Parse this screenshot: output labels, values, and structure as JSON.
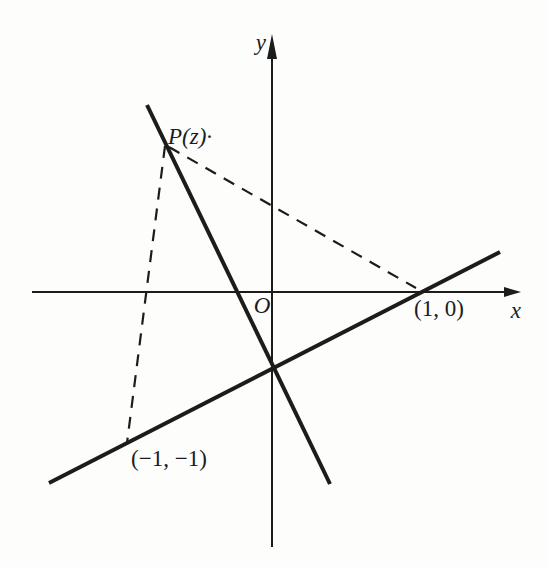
{
  "colors": {
    "background": "#fdfdfc",
    "ink": "#1c1c1c"
  },
  "labels": {
    "y_axis": "y",
    "x_axis": "x",
    "origin": "O",
    "point_p": "P(z)·",
    "point_1_0": "(1, 0)",
    "point_m1_m1": "(−1, −1)"
  },
  "geometry": {
    "x_axis": {
      "x1": 32,
      "y1": 292,
      "x2": 507,
      "y2": 292
    },
    "x_axis_arrow": {
      "points": "521,292 504,287 504,297"
    },
    "y_axis": {
      "x1": 272,
      "y1": 44,
      "x2": 272,
      "y2": 547
    },
    "y_axis_arrow": {
      "points": "272,34 267,59 277,59"
    },
    "solid_line_through_p": {
      "x1": 147,
      "y1": 105,
      "x2": 330,
      "y2": 484
    },
    "solid_line_through_1_0_and_m1_m1": {
      "x1": 49,
      "y1": 483,
      "x2": 500,
      "y2": 252
    },
    "dashed_p_to_m1_m1": {
      "x1": 165,
      "y1": 146,
      "x2": 127,
      "y2": 443
    },
    "dashed_p_to_1_0": {
      "x1": 169,
      "y1": 147,
      "x2": 416,
      "y2": 288
    },
    "label_positions": {
      "y_axis": {
        "x": 266,
        "y": 50
      },
      "x_axis": {
        "x": 521,
        "y": 318
      },
      "origin": {
        "x": 262,
        "y": 313
      },
      "point_p": {
        "x": 168,
        "y": 144
      },
      "point_1_0": {
        "x": 439,
        "y": 316
      },
      "point_m1_m1": {
        "x": 169,
        "y": 466
      }
    }
  }
}
